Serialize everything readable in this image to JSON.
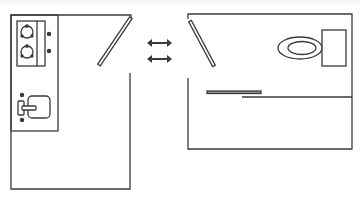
{
  "diagram": {
    "type": "floor-plan-comparison",
    "colors": {
      "stroke": "#3a3a3a",
      "door_fill": "#ffffff",
      "rail_fill": "#9a9a9a",
      "arrow": "#3a3a3a",
      "background": "#ffffff"
    },
    "left_room": {
      "label": "",
      "fixtures": [
        "stove-two-burner",
        "kitchen-sink",
        "swing-door"
      ]
    },
    "right_room": {
      "label": "",
      "fixtures": [
        "toilet",
        "swing-door",
        "sliding-door-rail"
      ]
    },
    "connector": {
      "icon": "bidirectional-arrows-icon",
      "count": 2
    }
  }
}
